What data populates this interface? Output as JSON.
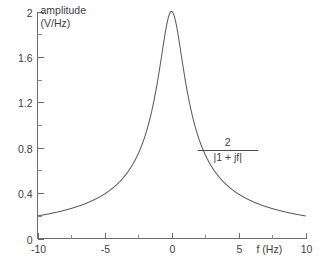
{
  "chart_data": {
    "type": "line",
    "title": "",
    "subtitle": "",
    "xlabel": "f (Hz)",
    "ylabel": "amplitude",
    "ylabel_units": "(V/Hz)",
    "xlim": [
      -10,
      10
    ],
    "ylim": [
      0,
      2
    ],
    "grid": false,
    "legend": "none",
    "x_ticks": [
      -10,
      -5,
      0,
      5,
      10
    ],
    "x_tick_labels": [
      "-10",
      "-5",
      "0",
      "5",
      "10"
    ],
    "x_minor_tick_step": 2.5,
    "y_ticks": [
      0,
      0.4,
      0.8,
      1.2,
      1.6,
      2
    ],
    "y_tick_labels": [
      "0",
      "0.4",
      "0.8",
      "1.2",
      "1.6",
      "2"
    ],
    "y_minor_tick_step": 0.2,
    "annotations": [
      {
        "name": "curve-equation",
        "numerator": "2",
        "denominator": "|1 + jf|",
        "x": 4.2,
        "y": 0.82
      }
    ],
    "series": [
      {
        "name": "amplitude-spectrum",
        "equation": "2/|1+jf|",
        "color": "#5c5c5c",
        "x": [
          -10,
          -9.5,
          -9,
          -8.5,
          -8,
          -7.5,
          -7,
          -6.5,
          -6,
          -5.5,
          -5,
          -4.5,
          -4,
          -3.5,
          -3,
          -2.75,
          -2.5,
          -2.25,
          -2,
          -1.75,
          -1.5,
          -1.25,
          -1,
          -0.875,
          -0.75,
          -0.625,
          -0.5,
          -0.375,
          -0.25,
          -0.125,
          0,
          0.125,
          0.25,
          0.375,
          0.5,
          0.625,
          0.75,
          0.875,
          1,
          1.25,
          1.5,
          1.75,
          2,
          2.25,
          2.5,
          2.75,
          3,
          3.5,
          4,
          4.5,
          5,
          5.5,
          6,
          6.5,
          7,
          7.5,
          8,
          8.5,
          9,
          9.5,
          10
        ],
        "values": [
          0.199,
          0.209,
          0.221,
          0.233,
          0.248,
          0.264,
          0.283,
          0.304,
          0.329,
          0.358,
          0.392,
          0.435,
          0.485,
          0.551,
          0.632,
          0.681,
          0.743,
          0.812,
          0.894,
          0.988,
          1.109,
          1.249,
          1.414,
          1.501,
          1.6,
          1.704,
          1.789,
          1.873,
          1.94,
          1.985,
          2.0,
          1.985,
          1.94,
          1.873,
          1.789,
          1.704,
          1.6,
          1.501,
          1.414,
          1.249,
          1.109,
          0.988,
          0.894,
          0.812,
          0.743,
          0.681,
          0.632,
          0.551,
          0.485,
          0.435,
          0.392,
          0.358,
          0.329,
          0.304,
          0.283,
          0.264,
          0.248,
          0.233,
          0.221,
          0.209,
          0.199
        ]
      }
    ]
  },
  "colors": {
    "curve": "#5c5c5c",
    "axis": "#6b6b6b",
    "text": "#3d3d3d",
    "background": "#ffffff"
  }
}
